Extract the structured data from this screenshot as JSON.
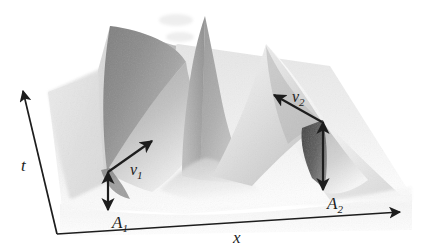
{
  "figure": {
    "background_color": "#ffffff",
    "ink_color": "#1d1d1d"
  },
  "axes": {
    "x": {
      "label": "x",
      "name": "horizontal-space-axis",
      "direction": "right",
      "arrow_from": [
        57,
        234
      ],
      "arrow_to": [
        404,
        211
      ],
      "label_pos": [
        237,
        238
      ]
    },
    "t": {
      "label": "t",
      "name": "vertical-time-axis",
      "direction": "up-left",
      "arrow_from": [
        57,
        234
      ],
      "arrow_to": [
        22,
        87
      ],
      "label_pos": [
        26,
        166
      ]
    }
  },
  "annotations": [
    {
      "id": "v1",
      "name": "velocity-arrow-left-soliton",
      "label": "v",
      "subscript": "1",
      "kind": "single-headed-vector",
      "from": [
        108,
        172
      ],
      "to": [
        156,
        138
      ],
      "label_pos": [
        134,
        172
      ]
    },
    {
      "id": "v2",
      "name": "velocity-arrow-right-soliton",
      "label": "v",
      "subscript": "2",
      "kind": "single-headed-vector",
      "from": [
        322,
        122
      ],
      "to": [
        271,
        93
      ],
      "label_pos": [
        296,
        99
      ]
    },
    {
      "id": "A1",
      "name": "amplitude-arrow-left-soliton",
      "label": "A",
      "subscript": "1",
      "kind": "double-headed-vector",
      "from": [
        108,
        170
      ],
      "to": [
        108,
        212
      ],
      "label_pos": [
        116,
        224
      ]
    },
    {
      "id": "A2",
      "name": "amplitude-arrow-right-soliton",
      "label": "A",
      "subscript": "2",
      "kind": "double-headed-vector",
      "from": [
        323,
        122
      ],
      "to": [
        323,
        192
      ],
      "label_pos": [
        330,
        205
      ]
    }
  ],
  "surface": {
    "name": "soliton-collision-surface",
    "grays": {
      "floor": "#fbfbfb",
      "plane_light": "#ededed",
      "plane_mid": "#dcdcdc",
      "ridge_left_face": "#8e8e8e",
      "ridge_left_dark": "#7a7a7a",
      "ridge_right_face": "#d2d2d2",
      "ridge_right_light": "#f2f2f2",
      "peak_face": "#a8a8a8",
      "shadow_dark": "#4a4a4a",
      "shadow_deep": "#3a3a3a"
    },
    "features": {
      "central_peak_apex": [
        205,
        16
      ],
      "left_crest_top": [
        112,
        24
      ],
      "right_crest_top": [
        268,
        44
      ],
      "left_crest_foot": [
        108,
        172
      ],
      "right_crest_foot": [
        323,
        122
      ]
    }
  }
}
